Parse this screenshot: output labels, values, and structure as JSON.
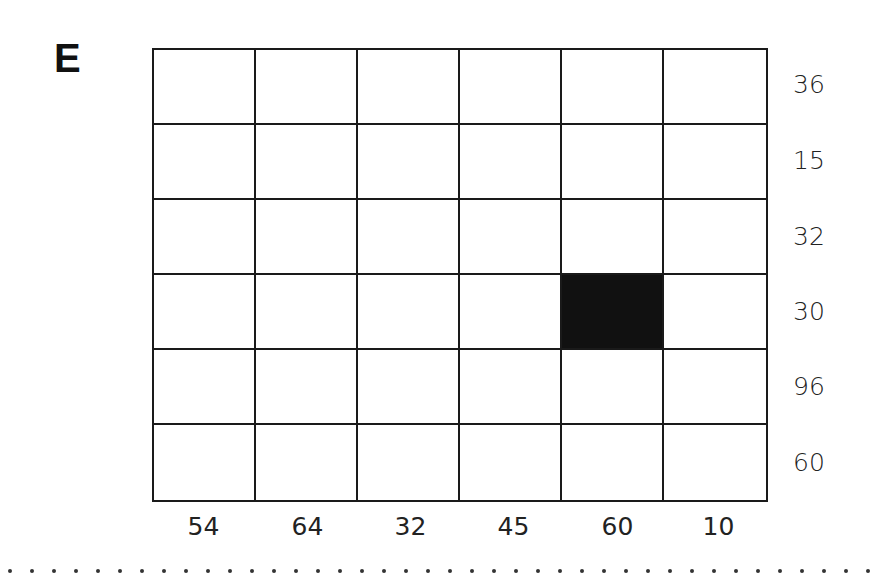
{
  "puzzle": {
    "label": "E",
    "rows": 6,
    "cols": 6,
    "row_clues": [
      "36",
      "15",
      "32",
      "30",
      "96",
      "60"
    ],
    "col_clues": [
      "54",
      "64",
      "32",
      "45",
      "60",
      "10"
    ],
    "filled_cells": [
      {
        "row": 3,
        "col": 4
      }
    ]
  }
}
